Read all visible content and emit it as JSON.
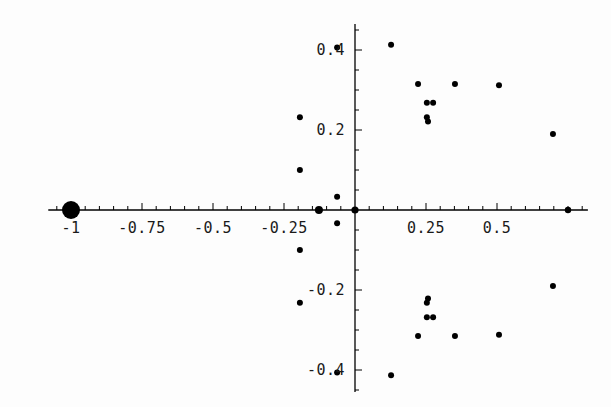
{
  "chart_data": {
    "type": "scatter",
    "title": "",
    "subtitle": "",
    "xlabel": "",
    "ylabel": "",
    "grid": false,
    "legend": null,
    "xlim": [
      -1.08,
      0.82
    ],
    "ylim": [
      -0.455,
      0.465
    ],
    "x_ticks_major": [
      -1,
      -0.75,
      -0.5,
      -0.25,
      0.25,
      0.5
    ],
    "x_tick_labels": [
      "-1",
      "-0.75",
      "-0.5",
      "-0.25",
      "0.25",
      "0.5"
    ],
    "y_ticks_major": [
      0.4,
      0.2,
      -0.2,
      -0.4
    ],
    "y_tick_labels": [
      "0.4",
      "0.2",
      "-0.2",
      "-0.4"
    ],
    "x_minor_step": 0.05,
    "y_minor_step": 0.05,
    "point_color": "#000000",
    "axis_color": "#000000",
    "marker": "circle",
    "default_marker_radius": 3.0,
    "points": [
      {
        "x": -1.0,
        "y": 0.0,
        "r": 9.0
      },
      {
        "x": -0.127,
        "y": 0.0,
        "r": 4.0
      },
      {
        "x": 0.0,
        "y": 0.0,
        "r": 3.6
      },
      {
        "x": 0.75,
        "y": 0.0,
        "r": 3.2
      },
      {
        "x": -0.194,
        "y": 0.232
      },
      {
        "x": -0.194,
        "y": 0.1
      },
      {
        "x": -0.194,
        "y": -0.1
      },
      {
        "x": -0.194,
        "y": -0.232
      },
      {
        "x": -0.063,
        "y": 0.406
      },
      {
        "x": -0.063,
        "y": 0.033
      },
      {
        "x": -0.063,
        "y": -0.033
      },
      {
        "x": -0.063,
        "y": -0.406
      },
      {
        "x": 0.127,
        "y": 0.413
      },
      {
        "x": 0.127,
        "y": -0.413
      },
      {
        "x": 0.222,
        "y": 0.315
      },
      {
        "x": 0.222,
        "y": -0.315
      },
      {
        "x": 0.253,
        "y": 0.268
      },
      {
        "x": 0.253,
        "y": -0.268
      },
      {
        "x": 0.275,
        "y": 0.268
      },
      {
        "x": 0.275,
        "y": -0.268
      },
      {
        "x": 0.253,
        "y": 0.232
      },
      {
        "x": 0.253,
        "y": -0.232
      },
      {
        "x": 0.257,
        "y": 0.221
      },
      {
        "x": 0.257,
        "y": -0.221
      },
      {
        "x": 0.352,
        "y": 0.315
      },
      {
        "x": 0.352,
        "y": -0.315
      },
      {
        "x": 0.507,
        "y": 0.312
      },
      {
        "x": 0.507,
        "y": -0.312
      },
      {
        "x": 0.697,
        "y": 0.19
      },
      {
        "x": 0.697,
        "y": -0.19
      }
    ]
  }
}
